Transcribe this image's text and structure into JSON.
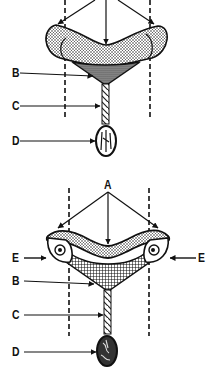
{
  "diagram": {
    "colors": {
      "ink": "#111111",
      "background": "#ffffff"
    },
    "top_panel": {
      "labels": {
        "b": "B",
        "c": "C",
        "d": "D"
      }
    },
    "bottom_panel": {
      "labels": {
        "a": "A",
        "b": "B",
        "c": "C",
        "d": "D",
        "e_left": "E",
        "e_right": "E"
      }
    }
  }
}
